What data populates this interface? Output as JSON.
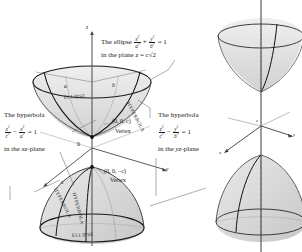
{
  "figure": {
    "title_alt": "Two-sheeted hyperboloid cross sections",
    "background": "#ffffff",
    "ink": "#1a1a1a",
    "surface_fill": "#d8d8d8"
  },
  "left_panel": {
    "annotations": {
      "ellipse_note": {
        "lead": "The ellipse",
        "eq_num1": "x",
        "eq_den1": "a",
        "eq_num2": "y",
        "eq_den2": "b",
        "eq_rhs": "= 1",
        "plane_line": "in the plane",
        "plane_var": "z",
        "plane_eq": "= c√2"
      },
      "hyperbola_xz": {
        "lead": "The hyperbola",
        "eq_num1": "z",
        "eq_den1": "c",
        "eq_num2": "x",
        "eq_den2": "a",
        "eq_minus": "−",
        "eq_rhs": "= 1",
        "plane_line_a": "in the",
        "plane_line_b": "xz",
        "plane_line_c": "-plane"
      },
      "hyperbola_yz": {
        "lead": "The hyperbola",
        "eq_num1": "z",
        "eq_den1": "c",
        "eq_num2": "y",
        "eq_den2": "b",
        "eq_minus": "−",
        "eq_rhs": "= 1",
        "plane_line_a": "in the",
        "plane_line_b": "yz",
        "plane_line_c": "-plane"
      },
      "vertex_top": {
        "point": "(0, 0, c)",
        "word": "Vertex"
      },
      "vertex_bottom": {
        "point": "(0, 0, −c)",
        "word": "Vertex"
      },
      "origin": "0"
    },
    "axis_labels": {
      "z": "z",
      "y": "y",
      "x": "x"
    },
    "semi_axis_labels": {
      "a": "a",
      "b": "b"
    },
    "curve_labels": {
      "ellipse_top": "ELLIPSE",
      "ellipse_bottom": "ELLIPSE",
      "hyperbola_upper_right": "HYPERBOLA",
      "hyperbola_lower_left": "HYPERBOLA",
      "hyperbola_lower_mid": "HYPERBOLA"
    }
  },
  "right_panel": {
    "axis_labels": {
      "z": "z",
      "y": "y",
      "x": "x"
    },
    "description": "full two-sheeted hyperboloid"
  }
}
